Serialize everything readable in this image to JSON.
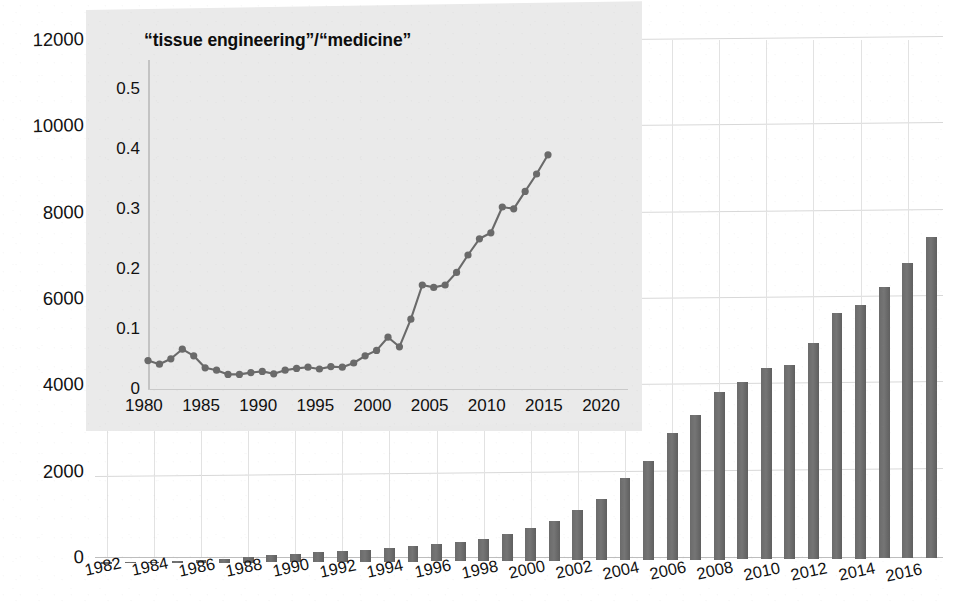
{
  "chart_data": [
    {
      "id": "main",
      "type": "bar",
      "title": "",
      "xlabel": "",
      "ylabel": "",
      "ylim": [
        0,
        12000
      ],
      "ytick_labels": [
        "0",
        "2000",
        "4000",
        "6000",
        "8000",
        "10000",
        "12000"
      ],
      "ytick_values": [
        0,
        2000,
        4000,
        6000,
        8000,
        10000,
        12000
      ],
      "grid": true,
      "legend": "none",
      "bar_color": "#6e6e6e",
      "categories": [
        1982,
        1983,
        1984,
        1985,
        1986,
        1987,
        1988,
        1989,
        1990,
        1991,
        1992,
        1993,
        1994,
        1995,
        1996,
        1997,
        1998,
        1999,
        2000,
        2001,
        2002,
        2003,
        2004,
        2005,
        2006,
        2007,
        2008,
        2009,
        2010,
        2011,
        2012,
        2013,
        2014,
        2015,
        2016,
        2017
      ],
      "xtick_labels": [
        "1982",
        "1984",
        "1986",
        "1988",
        "1990",
        "1992",
        "1994",
        "1996",
        "1998",
        "2000",
        "2002",
        "2004",
        "2006",
        "2008",
        "2010",
        "2012",
        "2014",
        "2016"
      ],
      "values": [
        10,
        15,
        25,
        40,
        60,
        90,
        130,
        170,
        200,
        230,
        250,
        280,
        320,
        360,
        400,
        450,
        520,
        620,
        760,
        920,
        1180,
        1430,
        1900,
        2300,
        2950,
        3350,
        3880,
        4120,
        4430,
        4500,
        5000,
        5700,
        5880,
        6300,
        6850,
        7450
      ]
    },
    {
      "id": "inset",
      "type": "line",
      "title": "“tissue engineering”/“medicine”",
      "xlabel": "",
      "ylabel": "",
      "xlim": [
        1980,
        2022
      ],
      "ylim": [
        0,
        0.55
      ],
      "ytick_labels": [
        "0",
        "0.1",
        "0.2",
        "0.3",
        "0.4",
        "0.5"
      ],
      "ytick_values": [
        0,
        0.1,
        0.2,
        0.3,
        0.4,
        0.5
      ],
      "xtick_labels": [
        "1980",
        "1985",
        "1990",
        "1995",
        "2000",
        "2005",
        "2010",
        "2015",
        "2020"
      ],
      "xtick_values": [
        1980,
        1985,
        1990,
        1995,
        2000,
        2005,
        2010,
        2015,
        2020
      ],
      "grid": false,
      "legend": "none",
      "line_color": "#6a6a6a",
      "marker": "circle",
      "x": [
        1980,
        1981,
        1982,
        1983,
        1984,
        1985,
        1986,
        1987,
        1988,
        1989,
        1990,
        1991,
        1992,
        1993,
        1994,
        1995,
        1996,
        1997,
        1998,
        1999,
        2000,
        2001,
        2002,
        2003,
        2004,
        2005,
        2006,
        2007,
        2008,
        2009,
        2010,
        2011,
        2012,
        2013,
        2014,
        2015
      ],
      "values": [
        0.049,
        0.043,
        0.052,
        0.068,
        0.057,
        0.037,
        0.033,
        0.026,
        0.026,
        0.029,
        0.031,
        0.027,
        0.033,
        0.036,
        0.038,
        0.035,
        0.039,
        0.038,
        0.045,
        0.057,
        0.066,
        0.088,
        0.072,
        0.118,
        0.175,
        0.171,
        0.175,
        0.196,
        0.225,
        0.252,
        0.262,
        0.305,
        0.302,
        0.331,
        0.36,
        0.392
      ]
    }
  ]
}
